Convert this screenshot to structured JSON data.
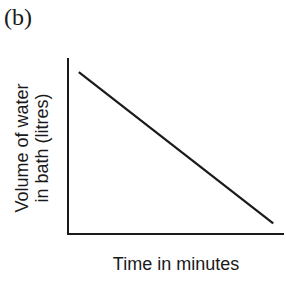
{
  "figure": {
    "panel_label": "(b)"
  },
  "chart_data": {
    "type": "line",
    "title": "",
    "xlabel": "Time in minutes",
    "ylabel": "Volume of water in bath (litres)",
    "ylabel_lines": [
      "Volume of water",
      "in bath (litres)"
    ],
    "x_ticks": [],
    "y_ticks": [],
    "grid": false,
    "legend": null,
    "series": [
      {
        "name": "Volume of water",
        "description": "Straight line decreasing linearly with time",
        "points": [
          {
            "x": 0.05,
            "y": 0.92
          },
          {
            "x": 0.95,
            "y": 0.06
          }
        ],
        "color": "#1a1a1a"
      }
    ],
    "xlim": [
      0,
      1
    ],
    "ylim": [
      0,
      1
    ]
  }
}
